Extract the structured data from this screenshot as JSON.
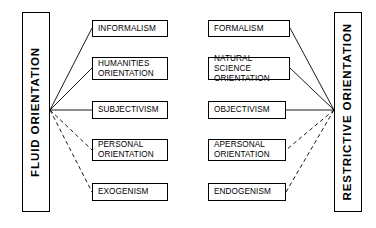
{
  "diagram": {
    "poles": {
      "left": {
        "label": "FLUID  ORIENTATION",
        "x": 22,
        "y": 12,
        "w": 28,
        "h": 200,
        "anchor_x": 50,
        "anchor_y": 110
      },
      "right": {
        "label": "RESTRICTIVE  ORIENTATION",
        "x": 334,
        "y": 12,
        "w": 28,
        "h": 200,
        "anchor_x": 334,
        "anchor_y": 110
      }
    },
    "left_nodes": [
      {
        "label": "INFORMALISM",
        "x": 92,
        "y": 20,
        "w": 76,
        "h": 17,
        "link": "solid",
        "edge_x": 92,
        "edge_y": 28
      },
      {
        "label": "HUMANITIES\nORIENTATION",
        "x": 92,
        "y": 57,
        "w": 76,
        "h": 23,
        "link": "solid",
        "edge_x": 92,
        "edge_y": 68
      },
      {
        "label": "SUBJECTIVISM",
        "x": 92,
        "y": 101,
        "w": 76,
        "h": 18,
        "link": "solid",
        "edge_x": 92,
        "edge_y": 110
      },
      {
        "label": "PERSONAL\nORIENTATION",
        "x": 92,
        "y": 139,
        "w": 76,
        "h": 22,
        "link": "dashed",
        "edge_x": 92,
        "edge_y": 150
      },
      {
        "label": "EXOGENISM",
        "x": 92,
        "y": 183,
        "w": 76,
        "h": 18,
        "link": "dashed",
        "edge_x": 92,
        "edge_y": 192
      }
    ],
    "right_nodes": [
      {
        "label": "FORMALISM",
        "x": 208,
        "y": 20,
        "w": 82,
        "h": 17,
        "link": "solid",
        "edge_x": 290,
        "edge_y": 28
      },
      {
        "label": "NATURAL SCIENCE\nORIENTATION",
        "x": 208,
        "y": 57,
        "w": 82,
        "h": 23,
        "link": "solid",
        "edge_x": 290,
        "edge_y": 68
      },
      {
        "label": "OBJECTIVISM",
        "x": 208,
        "y": 101,
        "w": 78,
        "h": 18,
        "link": "solid",
        "edge_x": 286,
        "edge_y": 110
      },
      {
        "label": "APERSONAL\nORIENTATION",
        "x": 208,
        "y": 139,
        "w": 78,
        "h": 22,
        "link": "dashed",
        "edge_x": 286,
        "edge_y": 150
      },
      {
        "label": "ENDOGENISM",
        "x": 208,
        "y": 183,
        "w": 78,
        "h": 18,
        "link": "dashed",
        "edge_x": 286,
        "edge_y": 192
      }
    ],
    "style": {
      "line_color": "#000000",
      "box_border_color": "#000000",
      "background": "#ffffff",
      "dash_pattern": "4,3"
    }
  }
}
